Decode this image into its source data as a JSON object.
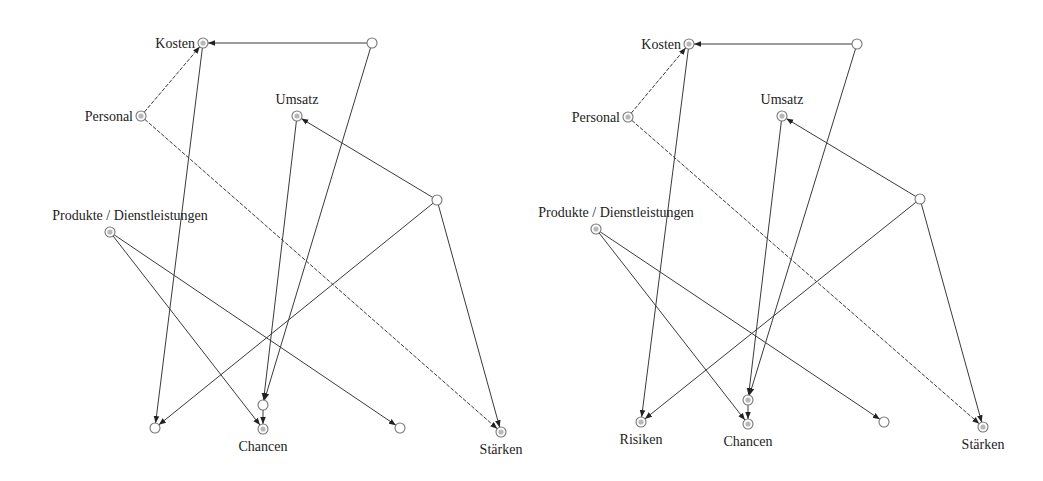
{
  "diagrams": [
    {
      "name": "left-graph",
      "nodes": [
        {
          "id": "kosten",
          "label": "Kosten",
          "x": 203,
          "y": 43,
          "label_pos": "left",
          "shaded": true
        },
        {
          "id": "n11",
          "label": "",
          "x": 372,
          "y": 43,
          "shaded": false
        },
        {
          "id": "personal",
          "label": "Personal",
          "x": 141,
          "y": 116,
          "label_pos": "left",
          "shaded": true
        },
        {
          "id": "umsatz",
          "label": "Umsatz",
          "x": 297,
          "y": 116,
          "label_pos": "above",
          "shaded": true
        },
        {
          "id": "n10",
          "label": "",
          "x": 437,
          "y": 200,
          "shaded": false
        },
        {
          "id": "produkte",
          "label": "Produkte / Dienstleistungen",
          "x": 110,
          "y": 232,
          "label_pos": "above",
          "shaded": true
        },
        {
          "id": "n7",
          "label": "",
          "x": 155,
          "y": 428,
          "shaded": false
        },
        {
          "id": "n5",
          "label": "",
          "x": 263,
          "y": 405,
          "shaded": false
        },
        {
          "id": "chancen",
          "label": "Chancen",
          "x": 263,
          "y": 429,
          "label_pos": "below",
          "shaded": true
        },
        {
          "id": "n2",
          "label": "",
          "x": 400,
          "y": 428,
          "shaded": false
        },
        {
          "id": "staerken",
          "label": "Stärken",
          "x": 501,
          "y": 432,
          "label_pos": "below",
          "shaded": true
        }
      ],
      "edges": [
        {
          "from": "n11",
          "to": "kosten",
          "dashed": false
        },
        {
          "from": "personal",
          "to": "kosten",
          "dashed": true
        },
        {
          "from": "kosten",
          "to": "n7",
          "dashed": false
        },
        {
          "from": "personal",
          "to": "staerken",
          "dashed": true
        },
        {
          "from": "n11",
          "to": "n5",
          "dashed": false
        },
        {
          "from": "umsatz",
          "to": "n5",
          "dashed": false
        },
        {
          "from": "n10",
          "to": "umsatz",
          "dashed": false
        },
        {
          "from": "n10",
          "to": "n7",
          "dashed": false
        },
        {
          "from": "n10",
          "to": "staerken",
          "dashed": false
        },
        {
          "from": "produkte",
          "to": "chancen",
          "dashed": false
        },
        {
          "from": "produkte",
          "to": "n2",
          "dashed": false
        },
        {
          "from": "n5",
          "to": "chancen",
          "dashed": false
        }
      ]
    },
    {
      "name": "right-graph",
      "nodes": [
        {
          "id": "kosten",
          "label": "Kosten",
          "x": 689,
          "y": 44,
          "label_pos": "left",
          "shaded": true
        },
        {
          "id": "n11",
          "label": "",
          "x": 857,
          "y": 44,
          "shaded": false
        },
        {
          "id": "personal",
          "label": "Personal",
          "x": 628,
          "y": 117,
          "label_pos": "left",
          "shaded": true
        },
        {
          "id": "umsatz",
          "label": "Umsatz",
          "x": 782,
          "y": 116,
          "label_pos": "above",
          "shaded": true
        },
        {
          "id": "n10",
          "label": "",
          "x": 920,
          "y": 199,
          "shaded": false
        },
        {
          "id": "produkte",
          "label": "Produkte / Dienstleistungen",
          "x": 596,
          "y": 229,
          "label_pos": "above",
          "shaded": true
        },
        {
          "id": "risiken",
          "label": "Risiken",
          "x": 641,
          "y": 422,
          "label_pos": "below",
          "shaded": true
        },
        {
          "id": "n5",
          "label": "",
          "x": 748,
          "y": 400,
          "shaded": true
        },
        {
          "id": "chancen",
          "label": "Chancen",
          "x": 748,
          "y": 424,
          "label_pos": "below",
          "shaded": true
        },
        {
          "id": "n2",
          "label": "",
          "x": 884,
          "y": 422,
          "shaded": false
        },
        {
          "id": "staerken",
          "label": "Stärken",
          "x": 983,
          "y": 427,
          "label_pos": "below",
          "shaded": true
        }
      ],
      "edges": [
        {
          "from": "n11",
          "to": "kosten",
          "dashed": false
        },
        {
          "from": "personal",
          "to": "kosten",
          "dashed": true
        },
        {
          "from": "kosten",
          "to": "risiken",
          "dashed": false
        },
        {
          "from": "personal",
          "to": "staerken",
          "dashed": true
        },
        {
          "from": "n11",
          "to": "n5",
          "dashed": false
        },
        {
          "from": "umsatz",
          "to": "n5",
          "dashed": false
        },
        {
          "from": "n10",
          "to": "umsatz",
          "dashed": false
        },
        {
          "from": "n10",
          "to": "risiken",
          "dashed": false
        },
        {
          "from": "n10",
          "to": "staerken",
          "dashed": false
        },
        {
          "from": "produkte",
          "to": "chancen",
          "dashed": false
        },
        {
          "from": "produkte",
          "to": "n2",
          "dashed": false
        },
        {
          "from": "n5",
          "to": "chancen",
          "dashed": false
        }
      ]
    }
  ]
}
